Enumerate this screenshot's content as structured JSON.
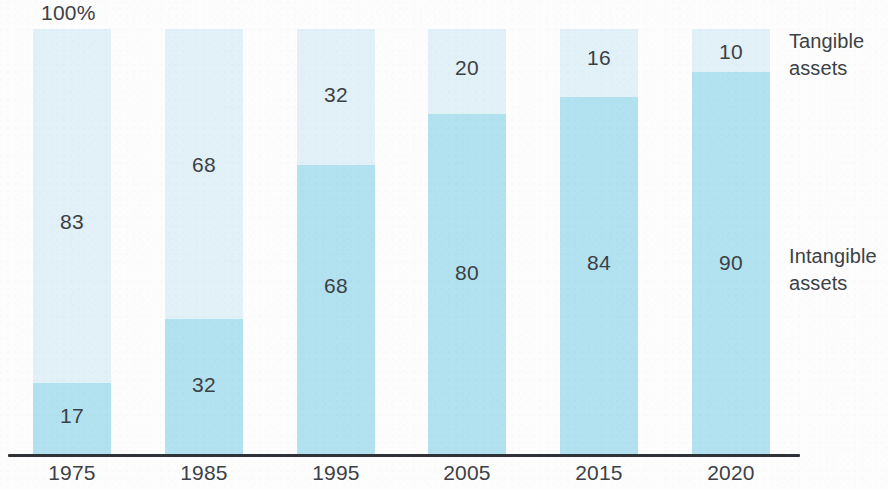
{
  "axis_max_label": "100%",
  "legend": {
    "tangible": {
      "line1": "Tangible",
      "line2": "assets"
    },
    "intangible": {
      "line1": "Intangible",
      "line2": "assets"
    }
  },
  "colors": {
    "tangible": "#e2f1f7",
    "intangible": "#b2e2ef",
    "text": "#3c4146",
    "axis": "#2f3338",
    "background": "#fdfdfd"
  },
  "chart_data": {
    "type": "bar",
    "title": "",
    "subtitle": "",
    "xlabel": "",
    "ylabel": "",
    "ylim": [
      0,
      100
    ],
    "stacked": true,
    "stack_total": 100,
    "grid": false,
    "legend_position": "right",
    "annotations": [
      "100%"
    ],
    "categories": [
      "1975",
      "1985",
      "1995",
      "2005",
      "2015",
      "2020"
    ],
    "series": [
      {
        "name": "Tangible assets",
        "values": [
          83,
          68,
          32,
          20,
          16,
          10
        ]
      },
      {
        "name": "Intangible assets",
        "values": [
          17,
          32,
          68,
          80,
          84,
          90
        ]
      }
    ],
    "bars": [
      {
        "category": "1975",
        "tangible": 83,
        "intangible": 17
      },
      {
        "category": "1985",
        "tangible": 68,
        "intangible": 32
      },
      {
        "category": "1995",
        "tangible": 32,
        "intangible": 68
      },
      {
        "category": "2005",
        "tangible": 20,
        "intangible": 80
      },
      {
        "category": "2015",
        "tangible": 16,
        "intangible": 84
      },
      {
        "category": "2020",
        "tangible": 10,
        "intangible": 90
      }
    ]
  },
  "layout": {
    "bar_x": [
      33,
      165,
      297,
      428,
      560,
      692
    ],
    "bar_width": 78
  }
}
